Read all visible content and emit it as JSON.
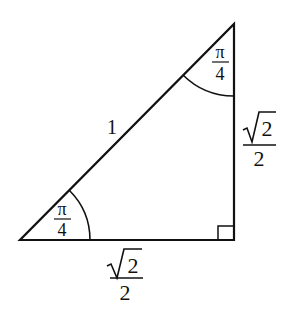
{
  "diagram": {
    "vertices": {
      "bottom_left": [
        20,
        240
      ],
      "right_angle": [
        234,
        240
      ],
      "top": [
        234,
        24
      ]
    },
    "hypotenuse_label": "1",
    "angle_bottom_left": {
      "numerator": "π",
      "denominator": "4"
    },
    "angle_top": {
      "numerator": "π",
      "denominator": "4"
    },
    "vertical_side_label": {
      "radicand": "2",
      "denominator": "2"
    },
    "base_label": {
      "radicand": "2",
      "denominator": "2"
    },
    "right_angle_marker": true
  }
}
